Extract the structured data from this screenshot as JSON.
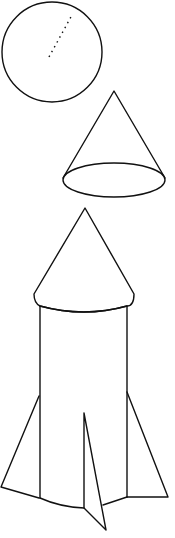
{
  "diagram": {
    "kind": "geometric-shapes-rocket",
    "stroke_color": "#111111",
    "background_color": "#ffffff",
    "shapes": [
      {
        "id": "sphere",
        "type": "circle",
        "label": "sphere with radius",
        "cx": 52,
        "cy": 52,
        "r": 50,
        "radius_line": {
          "x1": 49,
          "y1": 57,
          "x2": 72,
          "y2": 15,
          "style": "dotted"
        }
      },
      {
        "id": "cone",
        "type": "cone",
        "label": "cone",
        "apex": [
          114,
          91
        ],
        "base_center": [
          114,
          180
        ],
        "rx": 51,
        "ry": 17
      },
      {
        "id": "rocket",
        "type": "composite",
        "label": "rocket made of cone and cylinder with fins",
        "nose_cone": {
          "apex": [
            85,
            208
          ],
          "left": [
            34,
            297
          ],
          "right": [
            134,
            297
          ]
        },
        "cylinder": {
          "left_x": 40,
          "right_x": 127,
          "top_y": 305,
          "bottom_y": 500
        },
        "fins": [
          {
            "name": "left-fin",
            "points": [
              [
                39,
                395
              ],
              [
                0,
                488
              ],
              [
                39,
                498
              ]
            ]
          },
          {
            "name": "right-fin",
            "points": [
              [
                127,
                392
              ],
              [
                168,
                497
              ],
              [
                127,
                497
              ]
            ]
          },
          {
            "name": "center-fin",
            "points": [
              [
                84,
                413
              ],
              [
                84,
                507
              ],
              [
                106,
                530
              ],
              [
                102,
                504
              ]
            ]
          }
        ]
      }
    ]
  },
  "labels": {
    "sphere": "Sphere",
    "cone": "Cone",
    "rocket": "Rocket"
  }
}
